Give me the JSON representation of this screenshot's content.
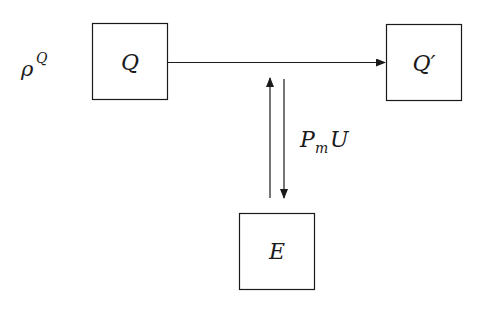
{
  "diagram": {
    "nodes": [
      {
        "id": "Q",
        "label": "Q",
        "x": 92,
        "y": 23,
        "w": 75,
        "h": 76
      },
      {
        "id": "Qprime",
        "label": "Q′",
        "x": 386,
        "y": 24,
        "w": 75,
        "h": 76
      },
      {
        "id": "E",
        "label": "E",
        "x": 239,
        "y": 213,
        "w": 75,
        "h": 76
      }
    ],
    "labels": {
      "rho_base": "ρ",
      "rho_sup": "Q",
      "interaction_base": "P",
      "interaction_sub": "m",
      "interaction_tail": "U"
    },
    "edges": [
      {
        "from": "Q",
        "to": "Qprime",
        "direction": "right"
      },
      {
        "from": "E",
        "to": "Q-Qprime-line",
        "direction": "up"
      },
      {
        "from": "Q-Qprime-line",
        "to": "E",
        "direction": "down"
      }
    ],
    "colors": {
      "stroke": "#1a1a1a",
      "background": "#ffffff"
    }
  }
}
